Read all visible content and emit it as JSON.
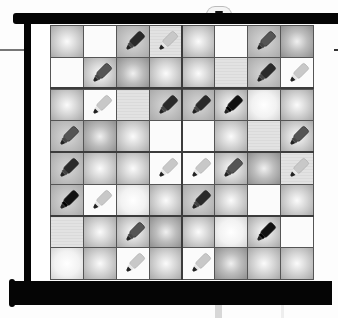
{
  "game": {
    "title": "Marker grid puzzle",
    "rows": 8,
    "cols": 8
  },
  "palette": {
    "frame": "#050505",
    "grid_line": "#555555",
    "marker_dark": "#2a2a2a",
    "marker_medium": "#555555",
    "marker_light": "#c8c8c8",
    "marker_black": "#111111"
  },
  "board": [
    [
      {
        "bg": "glow",
        "marker": null
      },
      {
        "bg": "white",
        "marker": null
      },
      {
        "bg": "grey",
        "marker": "dark"
      },
      {
        "bg": "flat",
        "marker": "light"
      },
      {
        "bg": "glow",
        "marker": null
      },
      {
        "bg": "white",
        "marker": null
      },
      {
        "bg": "grey",
        "marker": "medium"
      },
      {
        "bg": "glow-dark",
        "marker": null
      }
    ],
    [
      {
        "bg": "white",
        "marker": null
      },
      {
        "bg": "glow",
        "marker": "medium"
      },
      {
        "bg": "glow-dark",
        "marker": null
      },
      {
        "bg": "glow",
        "marker": null
      },
      {
        "bg": "glow",
        "marker": null
      },
      {
        "bg": "flat",
        "marker": null
      },
      {
        "bg": "grey",
        "marker": "dark"
      },
      {
        "bg": "white",
        "marker": "light"
      }
    ],
    [
      {
        "bg": "glow",
        "marker": null
      },
      {
        "bg": "white",
        "marker": "light"
      },
      {
        "bg": "flat",
        "marker": null
      },
      {
        "bg": "grey",
        "marker": "dark"
      },
      {
        "bg": "grey",
        "marker": "dark"
      },
      {
        "bg": "glow",
        "marker": "black"
      },
      {
        "bg": "glow-white",
        "marker": null
      },
      {
        "bg": "glow",
        "marker": null
      }
    ],
    [
      {
        "bg": "grey",
        "marker": "medium"
      },
      {
        "bg": "glow-dark",
        "marker": null
      },
      {
        "bg": "glow",
        "marker": null
      },
      {
        "bg": "white",
        "marker": null
      },
      {
        "bg": "white",
        "marker": null
      },
      {
        "bg": "glow",
        "marker": null
      },
      {
        "bg": "flat",
        "marker": null
      },
      {
        "bg": "glow",
        "marker": "medium"
      }
    ],
    [
      {
        "bg": "grey",
        "marker": "dark"
      },
      {
        "bg": "glow",
        "marker": null
      },
      {
        "bg": "glow",
        "marker": null
      },
      {
        "bg": "white",
        "marker": "light"
      },
      {
        "bg": "white",
        "marker": "light"
      },
      {
        "bg": "glow",
        "marker": "medium"
      },
      {
        "bg": "glow-dark",
        "marker": null
      },
      {
        "bg": "flat",
        "marker": "light"
      }
    ],
    [
      {
        "bg": "grey",
        "marker": "black"
      },
      {
        "bg": "white",
        "marker": "light"
      },
      {
        "bg": "glow-white",
        "marker": null
      },
      {
        "bg": "glow",
        "marker": null
      },
      {
        "bg": "grey",
        "marker": "dark"
      },
      {
        "bg": "glow",
        "marker": null
      },
      {
        "bg": "white",
        "marker": null
      },
      {
        "bg": "glow",
        "marker": null
      }
    ],
    [
      {
        "bg": "flat",
        "marker": null
      },
      {
        "bg": "glow",
        "marker": null
      },
      {
        "bg": "glow",
        "marker": "medium"
      },
      {
        "bg": "glow-dark",
        "marker": null
      },
      {
        "bg": "glow",
        "marker": null
      },
      {
        "bg": "glow-white",
        "marker": null
      },
      {
        "bg": "glow",
        "marker": "black"
      },
      {
        "bg": "white",
        "marker": null
      }
    ],
    [
      {
        "bg": "glow-white",
        "marker": null
      },
      {
        "bg": "glow",
        "marker": null
      },
      {
        "bg": "white",
        "marker": "light"
      },
      {
        "bg": "glow",
        "marker": null
      },
      {
        "bg": "white",
        "marker": "light"
      },
      {
        "bg": "glow-dark",
        "marker": null
      },
      {
        "bg": "glow",
        "marker": null
      },
      {
        "bg": "glow",
        "marker": null
      }
    ]
  ]
}
